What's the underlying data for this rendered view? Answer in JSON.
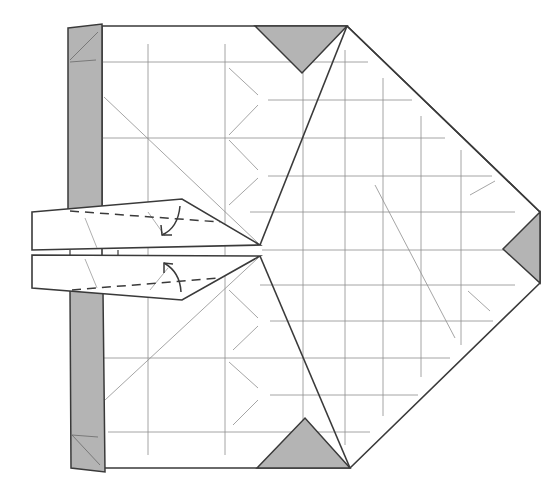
{
  "diagram": {
    "type": "origami-fold-step",
    "colors": {
      "paper_front": "#ffffff",
      "paper_back": "#b4b4b4",
      "outline": "#3a3a3a",
      "crease": "#8a8a8a",
      "valley_line": "#3a3a3a"
    },
    "instruction_markers": [
      {
        "name": "upper-flap-valley-fold",
        "kind": "valley-fold-dashed-line",
        "direction": "down"
      },
      {
        "name": "lower-flap-valley-fold",
        "kind": "valley-fold-dashed-line",
        "direction": "up"
      }
    ],
    "parts": {
      "left_strip": "colored (back side) vertical strip on left edge",
      "flaps": "two horizontal flaps pointing left",
      "top_triangle": "colored corner triangle at top",
      "bottom_triangle": "colored corner triangle at bottom",
      "right_triangle": "colored corner triangle at right tip"
    }
  }
}
